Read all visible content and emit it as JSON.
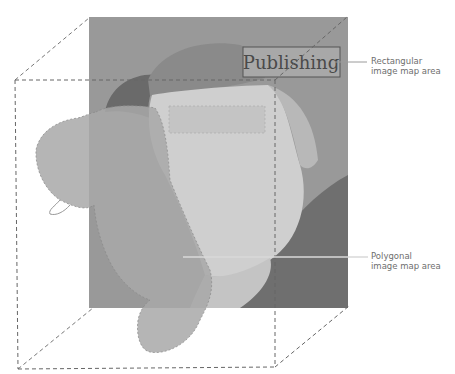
{
  "diagram": {
    "type": "image-map-illustration",
    "image_text": "Publishing",
    "colors": {
      "image_background": "#999999",
      "hair_silhouette": "#a6a6a6",
      "face_light": "#cfcfcf",
      "shirt_dark": "#6f6f6f",
      "polygon_overlay": "#b3b3b3",
      "rect_highlight": "#bdbdbd",
      "dashed_line": "#707070",
      "callout_line": "#9a9a9a",
      "callout_text": "#6e6e6e"
    }
  },
  "callouts": {
    "rectangular": {
      "line1": "Rectangular",
      "line2": "image map area"
    },
    "polygonal": {
      "line1": "Polygonal",
      "line2": "image map area"
    }
  }
}
